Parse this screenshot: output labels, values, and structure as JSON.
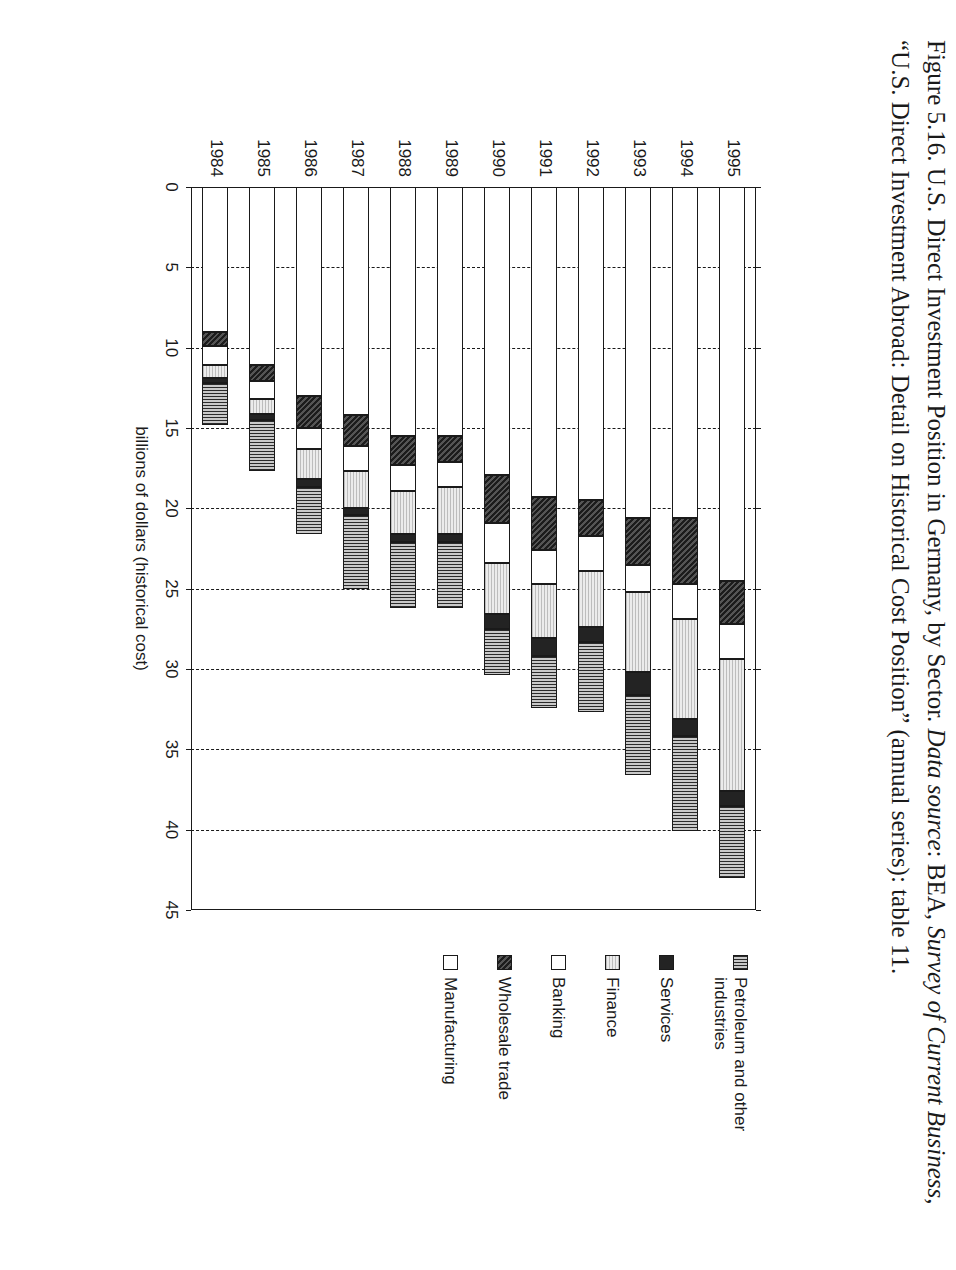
{
  "figure": {
    "caption_number": "Figure 5.16.",
    "caption_title": "U.S. Direct Investment Position in Germany, by Sector.",
    "caption_source_label": "Data source",
    "caption_source_rest": ": BEA,",
    "caption_source_pub": "Survey of Current Business",
    "caption_source_tail": ", “U.S. Direct Investment Abroad: Detail on Historical Cost Position” (annual series): table 11."
  },
  "legend": {
    "items": [
      {
        "label": "Petroleum and other industries",
        "swatch": "vertical-hatch-gray",
        "color": "#8f8f8f"
      },
      {
        "label": "Services",
        "swatch": "solid-black",
        "color": "#232323"
      },
      {
        "label": "Finance",
        "swatch": "light-gray-dotted",
        "color": "#dcdcdc"
      },
      {
        "label": "Banking",
        "swatch": "white",
        "color": "#ffffff"
      },
      {
        "label": "Wholesale trade",
        "swatch": "dark-textured",
        "color": "#3b3b3b"
      },
      {
        "label": "Manufacturing",
        "swatch": "white",
        "color": "#ffffff"
      }
    ]
  },
  "chart_data": {
    "type": "bar",
    "orientation": "horizontal-stacked",
    "title": "U.S. Direct Investment Position in Germany, by Sector",
    "xlabel": "",
    "ylabel": "billions of dollars (historical cost)",
    "ylim": [
      0,
      45
    ],
    "yticks": [
      0,
      5,
      10,
      15,
      20,
      25,
      30,
      35,
      40,
      45
    ],
    "ytick_labels": [
      "0",
      "5",
      "10",
      "15",
      "20",
      "25",
      "30",
      "35",
      "40",
      "45"
    ],
    "grid": "dashed-vertical-at-value-ticks",
    "legend_position": "right",
    "categories": [
      "1984",
      "1985",
      "1986",
      "1987",
      "1988",
      "1989",
      "1990",
      "1991",
      "1992",
      "1993",
      "1994",
      "1995"
    ],
    "series": [
      {
        "name": "Manufacturing",
        "values": [
          9.0,
          11.1,
          13.0,
          14.2,
          15.5,
          15.5,
          17.9,
          19.3,
          19.5,
          20.6,
          20.6,
          24.5
        ]
      },
      {
        "name": "Wholesale trade",
        "values": [
          0.9,
          1.0,
          2.0,
          1.9,
          1.8,
          1.6,
          3.0,
          3.3,
          2.2,
          2.9,
          4.1,
          2.7
        ]
      },
      {
        "name": "Banking",
        "values": [
          1.2,
          1.1,
          1.3,
          1.6,
          1.6,
          1.6,
          2.5,
          2.1,
          2.2,
          1.7,
          2.2,
          2.2
        ]
      },
      {
        "name": "Finance",
        "values": [
          0.8,
          0.9,
          1.9,
          2.3,
          2.7,
          2.9,
          3.2,
          3.4,
          3.5,
          5.0,
          6.2,
          8.2
        ]
      },
      {
        "name": "Services",
        "values": [
          0.3,
          0.4,
          0.5,
          0.4,
          0.5,
          0.5,
          0.9,
          1.1,
          0.9,
          1.4,
          1.1,
          0.9
        ]
      },
      {
        "name": "Petroleum and other industries",
        "values": [
          2.6,
          3.2,
          2.9,
          4.6,
          4.1,
          4.1,
          2.9,
          3.2,
          4.4,
          5.0,
          5.9,
          4.5
        ]
      }
    ],
    "totals": [
      14.8,
      17.7,
      21.6,
      25.0,
      26.2,
      26.2,
      30.4,
      32.4,
      32.7,
      36.6,
      40.1,
      43.0
    ]
  }
}
